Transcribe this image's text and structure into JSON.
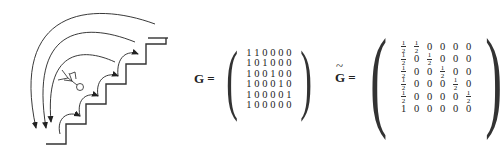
{
  "figure": {
    "illustration": "staircase-with-jumping-figure",
    "equation_g": {
      "label": "G =",
      "rows": [
        [
          "1",
          "1",
          "0",
          "0",
          "0",
          "0"
        ],
        [
          "1",
          "0",
          "1",
          "0",
          "0",
          "0"
        ],
        [
          "1",
          "0",
          "0",
          "1",
          "0",
          "0"
        ],
        [
          "1",
          "0",
          "0",
          "0",
          "1",
          "0"
        ],
        [
          "1",
          "0",
          "0",
          "0",
          "0",
          "1"
        ],
        [
          "1",
          "0",
          "0",
          "0",
          "0",
          "0"
        ]
      ]
    },
    "equation_g_tilde": {
      "label": "G =",
      "rows": [
        [
          "1/2",
          "1/2",
          "0",
          "0",
          "0",
          "0"
        ],
        [
          "1/2",
          "0",
          "1/2",
          "0",
          "0",
          "0"
        ],
        [
          "1/2",
          "0",
          "0",
          "1/2",
          "0",
          "0"
        ],
        [
          "1/2",
          "0",
          "0",
          "0",
          "1/2",
          "0"
        ],
        [
          "1/2",
          "0",
          "0",
          "0",
          "0",
          "1/2"
        ],
        [
          "1",
          "0",
          "0",
          "0",
          "0",
          "0"
        ]
      ]
    }
  }
}
